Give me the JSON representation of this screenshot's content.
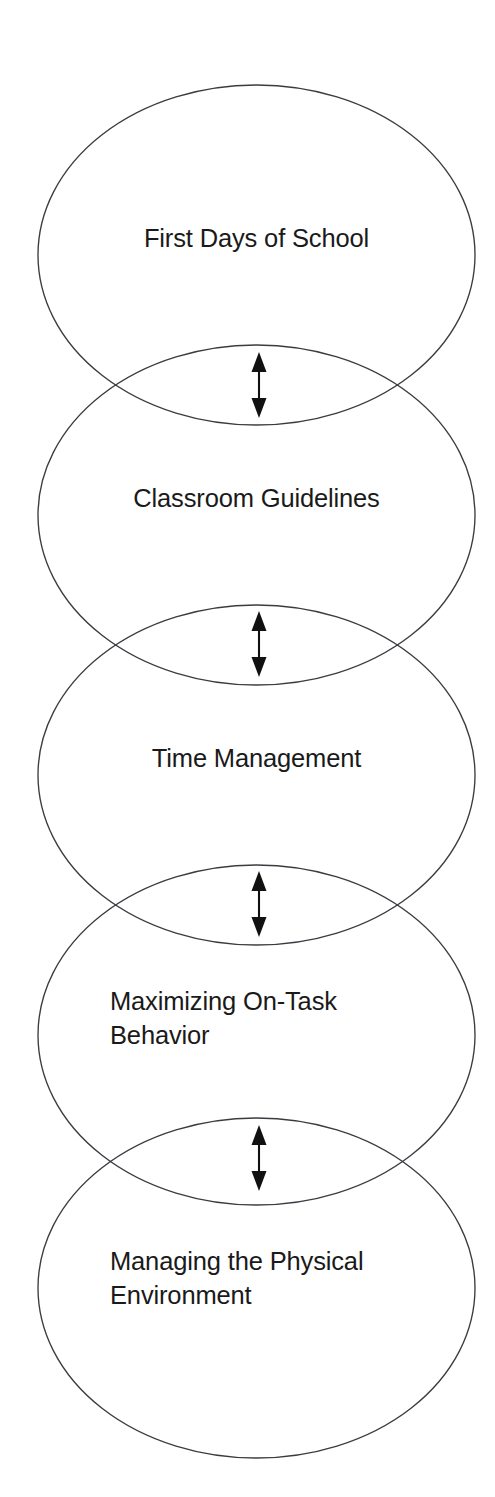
{
  "diagram": {
    "type": "vertical-overlapping-ellipse-chain",
    "background_color": "#ffffff",
    "stroke_color": "#3b3b42",
    "text_color": "#1a1a1a",
    "arrow_color": "#111111",
    "nodes": [
      {
        "id": "first-days-of-school",
        "label": "First Days of School",
        "align": "center",
        "cx": 256.5,
        "cy": 255,
        "rx": 218.5,
        "ry": 170,
        "label_top": 221
      },
      {
        "id": "classroom-guidelines",
        "label": "Classroom Guidelines",
        "align": "center",
        "cx": 256.5,
        "cy": 515,
        "rx": 218.5,
        "ry": 170,
        "label_top": 481
      },
      {
        "id": "time-management",
        "label": "Time Management",
        "align": "center",
        "cx": 256.5,
        "cy": 775,
        "rx": 218.5,
        "ry": 170,
        "label_top": 741
      },
      {
        "id": "maximizing-on-task-behavior",
        "label": "Maximizing On-Task\nBehavior",
        "align": "left",
        "cx": 256.5,
        "cy": 1035,
        "rx": 218.5,
        "ry": 170,
        "label_top": 984
      },
      {
        "id": "managing-the-physical-environment",
        "label": "Managing the Physical\nEnvironment",
        "align": "left",
        "cx": 256.5,
        "cy": 1288,
        "rx": 218.5,
        "ry": 170,
        "label_top": 1244
      }
    ],
    "connectors": [
      {
        "id": "connector-1",
        "from": "first-days-of-school",
        "to": "classroom-guidelines",
        "kind": "double-headed-arrow",
        "x": 259,
        "y_top": 354,
        "y_bottom": 416
      },
      {
        "id": "connector-2",
        "from": "classroom-guidelines",
        "to": "time-management",
        "kind": "double-headed-arrow",
        "x": 259,
        "y_top": 613,
        "y_bottom": 675
      },
      {
        "id": "connector-3",
        "from": "time-management",
        "to": "maximizing-on-task-behavior",
        "kind": "double-headed-arrow",
        "x": 259,
        "y_top": 873,
        "y_bottom": 935
      },
      {
        "id": "connector-4",
        "from": "maximizing-on-task-behavior",
        "to": "managing-the-physical-environment",
        "kind": "double-headed-arrow",
        "x": 259,
        "y_top": 1127,
        "y_bottom": 1189
      }
    ]
  }
}
